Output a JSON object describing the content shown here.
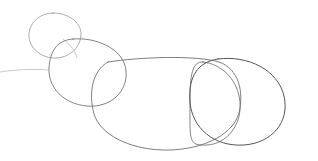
{
  "canvas": {
    "width": 318,
    "height": 161,
    "background_color": "#ffffff",
    "medium": "pencil-sketch",
    "description": "Hand-drawn overlapping circles sketch on plain white paper"
  },
  "style": {
    "stroke_color": "#6e6e74",
    "stroke_color_light": "#9b9ba2",
    "stroke_color_dark": "#55555c",
    "stroke_width": 0.9,
    "stroke_width_light": 0.7
  },
  "drawing": {
    "type": "line-art",
    "shape_count": 4,
    "shapes": [
      {
        "name": "small-circle-top-left",
        "cx": 55,
        "cy": 36,
        "rx": 26,
        "ry": 24,
        "tone": "light"
      },
      {
        "name": "medium-circle-left",
        "cx": 87,
        "cy": 70,
        "rx": 39,
        "ry": 34,
        "tone": "mid"
      },
      {
        "name": "large-blob-center",
        "cx": 168,
        "cy": 103,
        "rx": 72,
        "ry": 46,
        "tone": "mid"
      },
      {
        "name": "circle-right-outer",
        "cx": 237,
        "cy": 101,
        "rx": 48,
        "ry": 44,
        "tone": "dark"
      },
      {
        "name": "circle-right-inner",
        "cx": 222,
        "cy": 101,
        "rx": 33,
        "ry": 41,
        "tone": "mid"
      }
    ]
  },
  "paths": {
    "small_circle": "M 53 13 C 68 13 81 22 81 34 C 81 46 71 57 57 58 C 44 59 30 50 29 37 C 28 24 39 13 53 13 Z",
    "small_circle_overlap": "M 63 39 C 70 44 76 52 77 58",
    "medium_circle": "M 73 39 C 95 37 124 48 126 71 C 128 92 110 108 87 106 C 63 104 48 87 49 68 C 50 50 58 40 73 39 Z",
    "large_blob": "M 108 62 C 140 57 196 55 219 62 C 239 69 244 92 239 113 C 232 138 196 151 163 150 C 128 149 100 134 94 114 C 88 92 93 70 108 62 Z",
    "right_outer_circle": "M 218 59 C 248 55 278 70 284 96 C 290 122 272 143 244 145 C 214 147 192 128 190 102 C 188 76 198 62 218 59 Z",
    "right_inner_circle": "M 203 62 C 222 64 238 80 240 102 C 242 126 226 144 207 145 C 188 146 190 141 190 102 C 190 75 192 61 203 62 Z",
    "tail_left": "M 49 70 C 36 69 20 69 0 72"
  }
}
